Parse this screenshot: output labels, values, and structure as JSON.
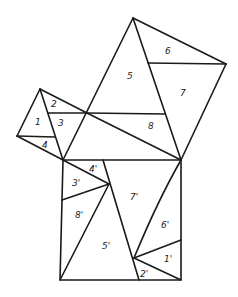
{
  "diagram": {
    "title": "",
    "colors": {
      "line": "#1a1a1a",
      "background": "#ffffff"
    },
    "labels": {
      "p1": "1",
      "p2": "2",
      "p3": "3",
      "p4": "4",
      "p5": "5",
      "p6": "6",
      "p7": "7",
      "p8": "8",
      "q1": "1'",
      "q2": "2'",
      "q3": "3'",
      "q4": "4'",
      "q5": "5'",
      "q6": "6'",
      "q7": "7'",
      "q8": "8'"
    }
  }
}
